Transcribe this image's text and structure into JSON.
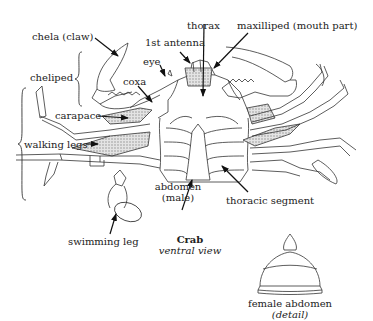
{
  "diagram": {
    "title": "Crab",
    "subtitle": "ventral view",
    "labels": {
      "chela": "chela (claw)",
      "cheliped": "cheliped",
      "eye": "eye",
      "first_antenna": "1st antenna",
      "thorax": "thorax",
      "maxilliped": "maxilliped (mouth part)",
      "coxa": "coxa",
      "carapace": "carapace",
      "walking_legs": "walking legs",
      "abdomen_male_1": "abdomen",
      "abdomen_male_2": "(male)",
      "thoracic_segment": "thoracic segment",
      "swimming_leg": "swimming leg",
      "female_abdomen": "female abdomen",
      "detail": "(detail)"
    },
    "colors": {
      "line": "#333333",
      "shade": "#bbbbbb",
      "arrow": "#111111"
    }
  }
}
